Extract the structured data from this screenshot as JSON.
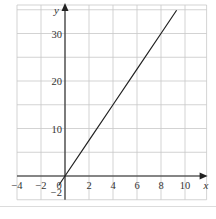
{
  "chart_data": {
    "type": "line",
    "title": "",
    "xlabel": "x",
    "ylabel": "y",
    "xlim": [
      -4,
      11.5
    ],
    "ylim": [
      -2,
      35
    ],
    "grid": true,
    "x_ticks": [
      -4,
      -2,
      0,
      2,
      4,
      6,
      8,
      10
    ],
    "x_tick_labels": [
      "−4",
      "−2",
      "0",
      "2",
      "4",
      "6",
      "8",
      "10"
    ],
    "y_ticks": [
      -2,
      10,
      20,
      30
    ],
    "y_tick_labels": [
      "−2",
      "10",
      "20",
      "30"
    ],
    "x_grid_step": 2,
    "y_grid_step": 5,
    "series": [
      {
        "name": "y = 3.75x",
        "x": [
          -0.53,
          0,
          2,
          4,
          6,
          8,
          9.3
        ],
        "y": [
          -2,
          0,
          7.5,
          15,
          22.5,
          30,
          34.9
        ]
      }
    ],
    "legend": null
  }
}
